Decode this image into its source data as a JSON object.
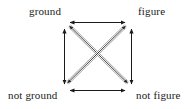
{
  "diagram": {
    "type": "semiotic-square",
    "background_color": "#ffffff",
    "line_color": "#1a1a1a",
    "diagonal_color": "#8c8c8c",
    "nodes": [
      {
        "id": "ground",
        "label": "ground",
        "position": "top-left",
        "x": 64,
        "y": 24
      },
      {
        "id": "figure",
        "label": "figure",
        "position": "top-right",
        "x": 131,
        "y": 24
      },
      {
        "id": "not-ground",
        "label": "not ground",
        "position": "bottom-left",
        "x": 64,
        "y": 88
      },
      {
        "id": "not-figure",
        "label": "not figure",
        "position": "bottom-right",
        "x": 131,
        "y": 88
      }
    ],
    "edges": [
      {
        "id": "top",
        "from": "ground",
        "to": "figure",
        "style": "solid",
        "arrows": "double",
        "orientation": "horizontal"
      },
      {
        "id": "bottom",
        "from": "not-ground",
        "to": "not-figure",
        "style": "solid",
        "arrows": "double",
        "orientation": "horizontal"
      },
      {
        "id": "left",
        "from": "ground",
        "to": "not-ground",
        "style": "solid",
        "arrows": "double",
        "orientation": "vertical"
      },
      {
        "id": "right",
        "from": "figure",
        "to": "not-figure",
        "style": "solid",
        "arrows": "double",
        "orientation": "vertical"
      },
      {
        "id": "diagonal-nw-se",
        "from": "ground",
        "to": "not-figure",
        "style": "double-line",
        "arrows": "double",
        "orientation": "diagonal"
      },
      {
        "id": "diagonal-ne-sw",
        "from": "figure",
        "to": "not-ground",
        "style": "double-line",
        "arrows": "double",
        "orientation": "diagonal"
      }
    ]
  }
}
